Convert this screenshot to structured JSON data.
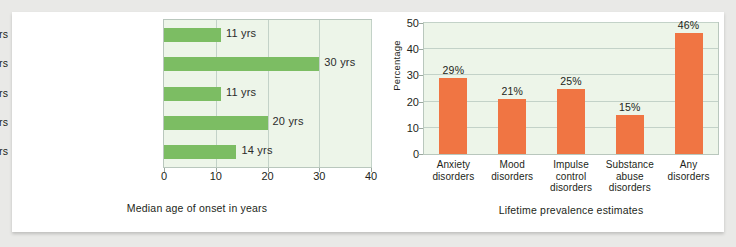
{
  "figure": {
    "background_color": "#e9e9e7",
    "card_color": "#ffffff"
  },
  "chart_data": [
    {
      "type": "bar",
      "orientation": "horizontal",
      "title": "",
      "xlabel": "Median age of onset in years",
      "ylabel": "",
      "xlim": [
        0,
        40
      ],
      "xticks": [
        "0",
        "10",
        "20",
        "30",
        "40"
      ],
      "grid": true,
      "legend": "none",
      "bar_color": "#7cbd63",
      "plot_background": "#edf5e9",
      "categories": [
        "Anxiety disorders",
        "Mood disorders",
        "Impulse control disorders",
        "Substance abuse disorders",
        "Any disorders"
      ],
      "values": [
        11,
        30,
        11,
        20,
        14
      ],
      "data_labels": [
        "11 yrs",
        "30 yrs",
        "11 yrs",
        "20 yrs",
        "14 yrs"
      ]
    },
    {
      "type": "bar",
      "orientation": "vertical",
      "title": "",
      "xlabel": "Lifetime prevalence estimates",
      "ylabel": "Percentage",
      "ylim": [
        0,
        50
      ],
      "yticks": [
        "0",
        "10",
        "20",
        "30",
        "40",
        "50"
      ],
      "grid": true,
      "legend": "none",
      "bar_color": "#f07543",
      "plot_background": "#edf5e9",
      "categories": [
        "Anxiety\ndisorders",
        "Mood\ndisorders",
        "Impulse\ncontrol\ndisorders",
        "Substance\nabuse\ndisorders",
        "Any\ndisorders"
      ],
      "category_lines": [
        [
          "Anxiety",
          "disorders"
        ],
        [
          "Mood",
          "disorders"
        ],
        [
          "Impulse",
          "control",
          "disorders"
        ],
        [
          "Substance",
          "abuse",
          "disorders"
        ],
        [
          "Any",
          "disorders"
        ]
      ],
      "values": [
        29,
        21,
        25,
        15,
        46
      ],
      "data_labels": [
        "29%",
        "21%",
        "25%",
        "15%",
        "46%"
      ]
    }
  ]
}
